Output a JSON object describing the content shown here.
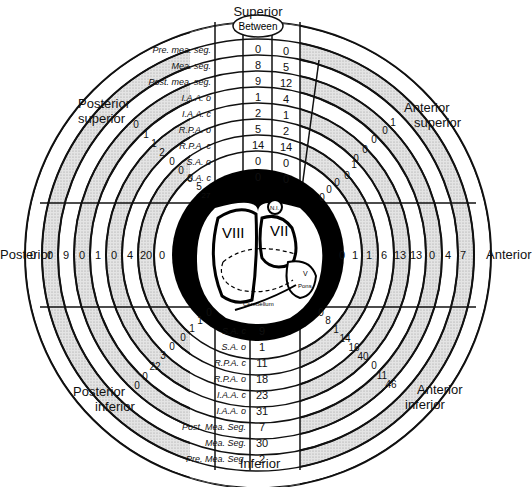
{
  "directions": {
    "superior": "Superior",
    "inferior": "Inferior",
    "posterior": "Posterior",
    "anterior": "Anterior",
    "posterior_superior": [
      "Posterior",
      "superior"
    ],
    "anterior_superior": [
      "Anterior",
      "superior"
    ],
    "posterior_inferior": [
      "Posterior",
      "inferior"
    ],
    "anterior_inferior": [
      "Anterior",
      "inferior"
    ]
  },
  "between_label": "Between",
  "superior_table": {
    "rows": [
      {
        "label": "Pre. mea. seg.",
        "left": "0",
        "right": "0"
      },
      {
        "label": "Mea. seg.",
        "left": "8",
        "right": "5"
      },
      {
        "label": "Post. mea. seg.",
        "left": "9",
        "right": "12"
      },
      {
        "label": "I.A.A. o",
        "left": "1",
        "right": "4"
      },
      {
        "label": "I.A.A. c",
        "left": "2",
        "right": "1"
      },
      {
        "label": "R.P.A. o",
        "left": "5",
        "right": "2"
      },
      {
        "label": "R.P.A. c",
        "left": "14",
        "right": "14"
      },
      {
        "label": "S.A. o",
        "left": "0",
        "right": "0"
      },
      {
        "label": "S.A. c",
        "left": "0",
        "right": "0"
      }
    ]
  },
  "inferior_table": {
    "rows": [
      {
        "label": "S.A. c",
        "value": "9"
      },
      {
        "label": "S.A. o",
        "value": "1"
      },
      {
        "label": "R.P.A. c",
        "value": "11"
      },
      {
        "label": "R.P.A. o",
        "value": "18"
      },
      {
        "label": "I.A.A. c",
        "value": "23"
      },
      {
        "label": "I.A.A. o",
        "value": "31"
      },
      {
        "label": "Post. Mea. Seg.",
        "value": "7"
      },
      {
        "label": "Mea. Seg.",
        "value": "30"
      },
      {
        "label": "Pre. Mea. Seg.",
        "value": "2"
      }
    ]
  },
  "ring_values": {
    "posterior_outer_to_inner": [
      "0",
      "0",
      "9",
      "0",
      "1",
      "0",
      "4",
      "20",
      "0"
    ],
    "anterior_inner_to_outer": [
      "0",
      "1",
      "1",
      "6",
      "13",
      "13",
      "0",
      "4",
      "7"
    ],
    "posterior_superior_outer_to_inner": [
      "0",
      "1",
      "1",
      "2",
      "0",
      "0",
      "0",
      "5",
      "27"
    ],
    "anterior_superior_inner_to_outer": [
      "0",
      "0",
      "0",
      "0",
      "1",
      "0",
      "0",
      "0",
      "0",
      "1"
    ],
    "posterior_inferior_inner_to_outer": [
      "0",
      "1",
      "1",
      "0",
      "0",
      "3",
      "22",
      "0",
      "0"
    ],
    "anterior_inferior_inner_to_outer": [
      "0",
      "8",
      "1",
      "14",
      "16",
      "40",
      "0",
      "11",
      "46"
    ]
  },
  "center_labels": {
    "viii": "VIII",
    "vii": "VII",
    "ni": "N.I.",
    "v": "V",
    "pons": "Pons",
    "cerebellum": "Cerebellum"
  },
  "colors": {
    "line": "#111111",
    "stipple": "#cfcfcf",
    "background": "#ffffff"
  }
}
